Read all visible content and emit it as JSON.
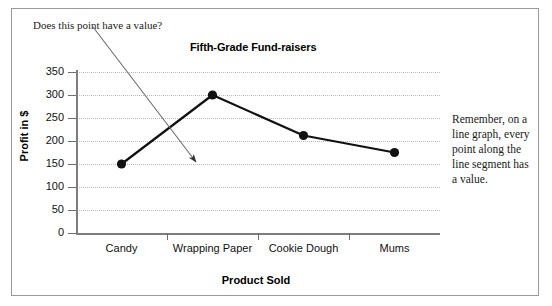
{
  "annotations": {
    "question_note": "Does this point have a value?",
    "remember_note": "Remember, on a line graph, every point along the line segment has a value."
  },
  "chart_data": {
    "type": "line",
    "title": "Fifth-Grade Fund-raisers",
    "xlabel": "Product Sold",
    "ylabel": "Profit in $",
    "categories": [
      "Candy",
      "Wrapping Paper",
      "Cookie Dough",
      "Mums"
    ],
    "values": [
      150,
      300,
      212,
      175
    ],
    "ytick_labels": [
      "350",
      "300",
      "250",
      "200",
      "150",
      "100",
      "50",
      "0"
    ],
    "ytick_values": [
      350,
      300,
      250,
      200,
      150,
      100,
      50,
      0
    ],
    "ylim": [
      0,
      350
    ],
    "ystep": 50,
    "grid": true,
    "legend": "none",
    "marker": "filled-circle",
    "series_color": "#111111",
    "grid_color": "#b9b9b9",
    "axis_color": "#7d7d7d"
  }
}
